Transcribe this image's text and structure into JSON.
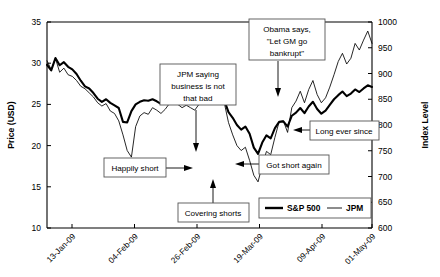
{
  "chart_data": {
    "type": "line",
    "title": "",
    "subtitle": "",
    "xlabel": "",
    "ylabel": "Price (USD)",
    "y2label": "Index Level",
    "grid": false,
    "legend_position": "bottom-right",
    "xlim": [
      0,
      78
    ],
    "ylim": [
      10,
      35
    ],
    "y2lim": [
      600,
      1000
    ],
    "yticks": [
      10,
      15,
      20,
      25,
      30,
      35
    ],
    "y2ticks": [
      600,
      650,
      700,
      750,
      800,
      850,
      900,
      950,
      1000
    ],
    "xtick_labels": [
      "13-Jan-09",
      "04-Feb-09",
      "26-Feb-09",
      "19-Mar-09",
      "09-Apr-09",
      "01-May-09"
    ],
    "xtick_positions": [
      6,
      21,
      36,
      51,
      66,
      78
    ],
    "series": [
      {
        "name": "JPM",
        "axis": "left",
        "units": "USD",
        "style": "thin",
        "values": [
          30.3,
          29.2,
          30.6,
          28.9,
          29.4,
          28.6,
          28.4,
          27.9,
          27.2,
          26.9,
          26.4,
          25.9,
          25.2,
          24.8,
          25.1,
          24.2,
          23.9,
          23.0,
          21.3,
          19.4,
          18.6,
          22.3,
          23.6,
          24.0,
          23.8,
          24.6,
          24.3,
          23.9,
          24.4,
          25.1,
          27.4,
          25.0,
          24.6,
          24.9,
          24.6,
          24.3,
          25.0,
          26.0,
          26.5,
          27.2,
          25.9,
          26.1,
          25.2,
          22.8,
          21.3,
          20.0,
          19.4,
          19.8,
          18.2,
          16.4,
          15.6,
          17.6,
          19.3,
          18.9,
          21.0,
          22.9,
          23.0,
          21.6,
          24.6,
          25.4,
          26.6,
          25.2,
          26.8,
          27.9,
          26.2,
          25.2,
          25.8,
          27.1,
          28.6,
          30.2,
          31.2,
          29.9,
          30.6,
          32.4,
          31.6,
          32.8,
          33.9,
          32.4
        ]
      },
      {
        "name": "S&P 500",
        "axis": "right",
        "units": "Index",
        "style": "thick",
        "values": [
          917,
          906,
          930,
          916,
          922,
          913,
          908,
          899,
          886,
          875,
          871,
          862,
          851,
          845,
          850,
          843,
          838,
          833,
          806,
          805,
          827,
          840,
          845,
          848,
          847,
          850,
          846,
          841,
          845,
          850,
          869,
          849,
          846,
          848,
          845,
          843,
          848,
          856,
          861,
          868,
          854,
          858,
          848,
          825,
          814,
          800,
          791,
          797,
          783,
          756,
          744,
          766,
          780,
          774,
          794,
          806,
          807,
          797,
          818,
          824,
          833,
          823,
          836,
          845,
          831,
          822,
          828,
          839,
          850,
          858,
          865,
          856,
          861,
          869,
          864,
          871,
          877,
          874
        ]
      }
    ],
    "annotations": [
      {
        "id": "jpm-saying",
        "text": [
          "JPM saying",
          "business is not",
          "that bad"
        ],
        "arrow": "down",
        "target_label": "JPM low, late Feb"
      },
      {
        "id": "obama-says",
        "text": [
          "Obama says,",
          "\"Let GM go",
          "bankrupt\""
        ],
        "arrow": "down",
        "target_label": "Late March S&P peak"
      },
      {
        "id": "happily-short",
        "text": [
          "Happily short"
        ],
        "arrow": "right",
        "target_label": "Mid Feb decline"
      },
      {
        "id": "covering-shorts",
        "text": [
          "Covering shorts"
        ],
        "arrow": "up",
        "target_label": "Early March bottom"
      },
      {
        "id": "got-short-again",
        "text": [
          "Got short again"
        ],
        "arrow": "left",
        "target_label": "Mid March rally"
      },
      {
        "id": "long-ever-since",
        "text": [
          "Long ever since"
        ],
        "arrow": "left",
        "target_label": "April uptrend"
      }
    ],
    "legend": [
      {
        "name": "S&P 500",
        "style": "thick"
      },
      {
        "name": "JPM",
        "style": "thin"
      }
    ],
    "colors": {
      "series": "#000000",
      "axis": "#000000",
      "background": "#ffffff",
      "annotation_border": "#555555"
    }
  }
}
